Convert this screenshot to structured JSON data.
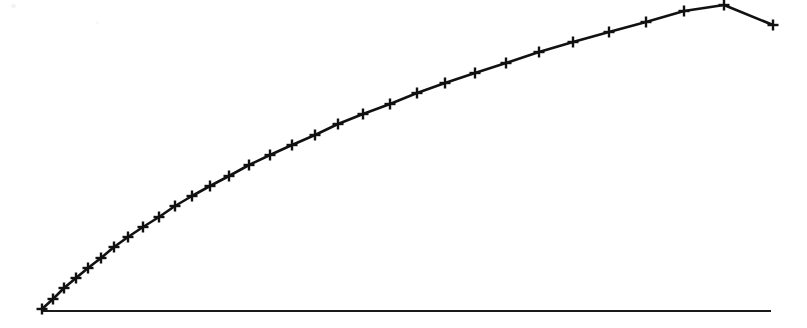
{
  "figure": {
    "title": "",
    "background_color": "#ffffff",
    "ink_color": "#111111",
    "width": 807,
    "height": 328,
    "caption": "",
    "appearance": "scanned monochrome line plot"
  },
  "axes": {
    "baseline_label": "",
    "baseline_color": "#1a1a1a",
    "baseline_y_px": 311,
    "baseline_x_start_px": 42,
    "baseline_x_end_px": 771,
    "baseline_stroke_px": 2.2,
    "x_ticks": [],
    "y_ticks": [],
    "grid": false,
    "frame": false
  },
  "series_style": {
    "line_color": "#111111",
    "line_width_px": 2.6,
    "marker": "plus",
    "marker_size_px": 11,
    "marker_stroke_px": 2.4,
    "legend": "none"
  },
  "chart_data": {
    "type": "line",
    "title": "",
    "subtitle": "",
    "xlabel": "",
    "ylabel": "",
    "xlim": [
      0,
      1
    ],
    "ylim": [
      0,
      1
    ],
    "grid": false,
    "legend_position": "none",
    "series": [
      {
        "name": "curve",
        "marker": "plus",
        "n_points": 32,
        "shape": "concave-down square-root growth",
        "x": [
          0.0,
          0.0152,
          0.0308,
          0.0471,
          0.0641,
          0.0821,
          0.1008,
          0.1205,
          0.1412,
          0.1629,
          0.1857,
          0.2096,
          0.2348,
          0.2611,
          0.2888,
          0.3178,
          0.3483,
          0.3802,
          0.4136,
          0.4487,
          0.4854,
          0.5238,
          0.564,
          0.606,
          0.6499,
          0.6957,
          0.7435,
          0.7934,
          0.8454,
          0.8996,
          0.956,
          1.0
        ],
        "y": [
          0.0,
          0.0323,
          0.0645,
          0.0968,
          0.129,
          0.1613,
          0.1935,
          0.2258,
          0.2581,
          0.2903,
          0.3226,
          0.3548,
          0.3871,
          0.4194,
          0.4516,
          0.4839,
          0.5161,
          0.5484,
          0.5806,
          0.6129,
          0.6452,
          0.6774,
          0.7097,
          0.7419,
          0.7742,
          0.8065,
          0.8387,
          0.871,
          0.9032,
          0.9355,
          0.9677,
          1.0
        ],
        "pixel_points": [
          [
            42,
            309
          ],
          [
            53,
            299
          ],
          [
            64,
            288
          ],
          [
            76,
            278
          ],
          [
            88,
            268
          ],
          [
            101,
            258
          ],
          [
            114,
            247
          ],
          [
            128,
            237
          ],
          [
            143,
            227
          ],
          [
            159,
            217
          ],
          [
            175,
            206
          ],
          [
            192,
            196
          ],
          [
            210,
            186
          ],
          [
            229,
            176
          ],
          [
            249,
            165
          ],
          [
            270,
            155
          ],
          [
            292,
            145
          ],
          [
            315,
            135
          ],
          [
            338,
            124
          ],
          [
            363,
            114
          ],
          [
            390,
            104
          ],
          [
            417,
            93
          ],
          [
            445,
            83
          ],
          [
            475,
            73
          ],
          [
            506,
            63
          ],
          [
            539,
            52
          ],
          [
            573,
            42
          ],
          [
            609,
            32
          ],
          [
            646,
            22
          ],
          [
            684,
            11
          ],
          [
            724,
            5
          ],
          [
            773,
            25
          ]
        ]
      }
    ]
  },
  "artifacts": {
    "speck_top_left": "faint-scan-speck",
    "speck_upper_mid": "faint-scan-speck",
    "speck_upper_right": "faint-scan-speck"
  }
}
